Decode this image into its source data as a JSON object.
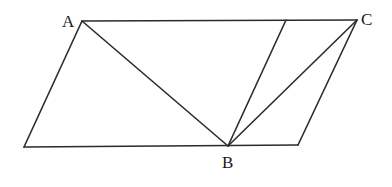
{
  "diagram": {
    "type": "geometry",
    "points": {
      "A": {
        "x": 82,
        "y": 21,
        "label": "A",
        "label_x": 62,
        "label_y": 27
      },
      "C": {
        "x": 357,
        "y": 20,
        "label": "C",
        "label_x": 361,
        "label_y": 25
      },
      "B": {
        "x": 228,
        "y": 146,
        "label": "B",
        "label_x": 222,
        "label_y": 168
      },
      "D": {
        "x": 24,
        "y": 147
      },
      "E": {
        "x": 298,
        "y": 145
      },
      "F": {
        "x": 286,
        "y": 20
      }
    },
    "segments": [
      {
        "name": "AC",
        "from": "A",
        "to": "C"
      },
      {
        "name": "AD",
        "from": "A",
        "to": "D"
      },
      {
        "name": "DE",
        "from": "D",
        "to": "E"
      },
      {
        "name": "EC",
        "from": "E",
        "to": "C"
      },
      {
        "name": "AB",
        "from": "A",
        "to": "B"
      },
      {
        "name": "BF",
        "from": "B",
        "to": "F"
      },
      {
        "name": "BC",
        "from": "B",
        "to": "C"
      }
    ],
    "labels": [
      "A",
      "C",
      "B"
    ],
    "colors": {
      "line": "#2b2b2b",
      "text": "#1a1a1a",
      "background": "#ffffff"
    }
  }
}
